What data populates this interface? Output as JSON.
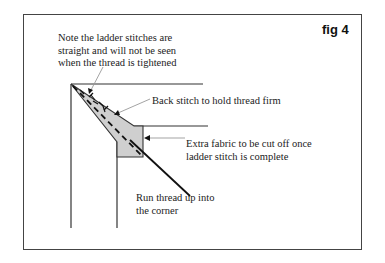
{
  "figure": {
    "label": "fig 4"
  },
  "annotations": {
    "ladder_note": {
      "line1": "Note the ladder stitches are",
      "line2": "straight and will not be seen",
      "line3": "when the thread is tightened"
    },
    "back_stitch": "Back stitch to hold thread firm",
    "extra_fabric": {
      "line1": "Extra fabric to be cut off once",
      "line2": "ladder stitch is complete"
    },
    "run_thread": {
      "line1": "Run thread up into",
      "line2": "the corner"
    }
  },
  "colors": {
    "fabric_fill": "#c8c8c8",
    "line": "#222222",
    "pointer": "#999999",
    "border": "#444444"
  }
}
